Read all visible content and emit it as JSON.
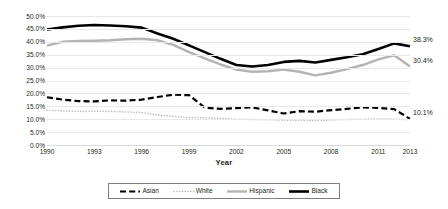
{
  "chart_data": {
    "type": "line",
    "title": "",
    "xlabel": "Year",
    "ylabel": "",
    "xlim": [
      1990,
      2013
    ],
    "ylim": [
      0,
      50
    ],
    "ytick_labels": [
      "50.0%",
      "45.0%",
      "40.0%",
      "35.0%",
      "30.0%",
      "25.0%",
      "20.0%",
      "15.0%",
      "10.0%",
      "5.0%",
      "0.0%"
    ],
    "ytick_values": [
      50,
      45,
      40,
      35,
      30,
      25,
      20,
      15,
      10,
      5,
      0
    ],
    "xtick_labels": [
      "1990",
      "1993",
      "1996",
      "1999",
      "2002",
      "2005",
      "2008",
      "2011",
      "2013"
    ],
    "xtick_values": [
      1990,
      1993,
      1996,
      1999,
      2002,
      2005,
      2008,
      2011,
      2013
    ],
    "grid": true,
    "legend_position": "bottom",
    "x": [
      1990,
      1991,
      1992,
      1993,
      1994,
      1995,
      1996,
      1997,
      1998,
      1999,
      2000,
      2001,
      2002,
      2003,
      2004,
      2005,
      2006,
      2007,
      2008,
      2009,
      2010,
      2011,
      2012,
      2013
    ],
    "series": [
      {
        "name": "Asian",
        "style": "dashed",
        "color": "#000000",
        "width": 2.2,
        "values": [
          18.5,
          17.6,
          17.0,
          16.9,
          17.3,
          17.2,
          17.6,
          18.6,
          19.5,
          19.3,
          14.5,
          14.0,
          14.3,
          14.6,
          13.4,
          12.2,
          13.1,
          12.9,
          13.5,
          14.0,
          14.6,
          14.4,
          13.9,
          10.1
        ],
        "end_label": "10.1%"
      },
      {
        "name": "White",
        "style": "dotted",
        "color": "#bfbfbf",
        "width": 1.6,
        "values": [
          13.5,
          13.2,
          13.0,
          13.1,
          13.0,
          12.8,
          12.6,
          11.6,
          11.1,
          10.6,
          10.5,
          10.3,
          10.0,
          9.9,
          9.8,
          9.6,
          9.6,
          9.5,
          9.7,
          9.9,
          10.0,
          10.1,
          10.0,
          9.8
        ],
        "end_label": ""
      },
      {
        "name": "Hispanic",
        "style": "solid",
        "color": "#b3b3b3",
        "width": 2.4,
        "values": [
          38.5,
          40.0,
          40.3,
          40.4,
          40.6,
          41.0,
          41.2,
          40.6,
          38.8,
          36.0,
          33.6,
          31.2,
          29.2,
          28.4,
          28.6,
          29.2,
          28.4,
          27.0,
          28.0,
          29.4,
          31.0,
          33.2,
          34.8,
          30.4
        ],
        "end_label": "30.4%"
      },
      {
        "name": "Black",
        "style": "solid",
        "color": "#000000",
        "width": 2.6,
        "values": [
          44.8,
          45.6,
          46.2,
          46.5,
          46.3,
          46.0,
          45.5,
          43.2,
          41.2,
          38.6,
          36.0,
          33.4,
          31.0,
          30.4,
          31.0,
          32.2,
          32.6,
          32.0,
          33.0,
          34.0,
          35.2,
          37.2,
          39.4,
          38.3
        ],
        "end_label": "38.3%"
      }
    ]
  },
  "legend": {
    "items": [
      {
        "label": "Asian"
      },
      {
        "label": "White"
      },
      {
        "label": "Hispanic"
      },
      {
        "label": "Black"
      }
    ]
  },
  "end_labels": [
    {
      "name": "black-end-label",
      "text": "38.3%"
    },
    {
      "name": "hispanic-end-label",
      "text": "30.4%"
    },
    {
      "name": "asian-end-label",
      "text": "10.1%"
    }
  ]
}
